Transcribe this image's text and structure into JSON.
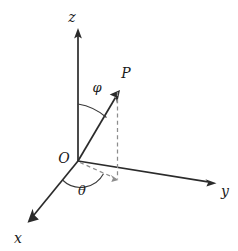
{
  "figure": {
    "background_color": "#ffffff",
    "width": 238,
    "height": 251
  },
  "colors": {
    "axis": "#2b2b2b",
    "dashed": "#8d8d8d",
    "arc": "#3a3a3a",
    "label": "#1a1a1a",
    "background": "#ffffff"
  },
  "labels": {
    "z_axis": "z",
    "y_axis": "y",
    "x_axis": "x",
    "origin": "O",
    "point": "P",
    "polar_angle": "φ",
    "azimuthal_angle": "θ"
  },
  "geometry": {
    "origin": {
      "x": 78,
      "y": 161
    },
    "z_axis_tip": {
      "x": 78,
      "y": 30
    },
    "y_axis_tip": {
      "x": 215,
      "y": 183
    },
    "x_axis_tip": {
      "x": 28,
      "y": 222
    },
    "point_p": {
      "x": 119,
      "y": 91
    },
    "projection_point": {
      "x": 117,
      "y": 181
    }
  }
}
